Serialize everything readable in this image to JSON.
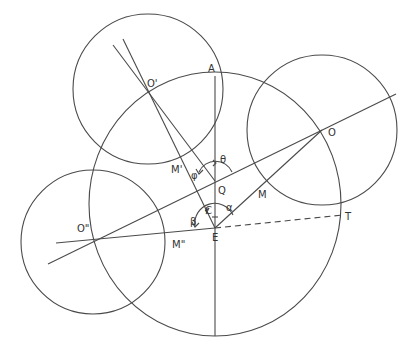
{
  "diagram": {
    "type": "geometry-construction",
    "colors": {
      "stroke": "#4a4a4a",
      "label": "#333333",
      "background": "#ffffff"
    },
    "points": {
      "O_prime": {
        "label": "O'",
        "x": 148,
        "y": 92
      },
      "O": {
        "label": "O",
        "x": 322,
        "y": 130
      },
      "O_double_prime": {
        "label": "O\"",
        "x": 93,
        "y": 242
      },
      "A": {
        "label": "A",
        "x": 215,
        "y": 76
      },
      "Q": {
        "label": "Q",
        "x": 215,
        "y": 181
      },
      "C": {
        "label": "C",
        "x": 215,
        "y": 210
      },
      "E": {
        "label": "E",
        "x": 215,
        "y": 228
      },
      "M": {
        "label": "M",
        "x": 264,
        "y": 184
      },
      "M_prime": {
        "label": "M'",
        "x": 186,
        "y": 162
      },
      "M_double_prime": {
        "label": "M\"",
        "x": 171,
        "y": 230
      },
      "T": {
        "label": "T",
        "x": 343,
        "y": 215
      }
    },
    "angles": {
      "theta": "θ",
      "phi": "φ",
      "alpha": "α",
      "beta": "β"
    },
    "circles": [
      {
        "name": "circle-O-prime",
        "cx": 148,
        "cy": 89,
        "r": 75
      },
      {
        "name": "circle-O",
        "cx": 322,
        "cy": 130,
        "r": 75
      },
      {
        "name": "circle-O-double-prime",
        "cx": 93,
        "cy": 242,
        "r": 72
      },
      {
        "name": "big-circle",
        "cx": 215,
        "cy": 204,
        "rx": 126,
        "ry": 132
      }
    ]
  }
}
